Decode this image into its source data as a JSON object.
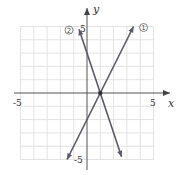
{
  "chart_data": {
    "type": "line",
    "title": "",
    "xlabel": "x",
    "ylabel": "y",
    "xlim": [
      -5,
      5
    ],
    "ylim": [
      -5,
      5
    ],
    "grid": true,
    "x_tick_labels": [
      "-5",
      "5"
    ],
    "y_tick_labels": [
      "5",
      "-5"
    ],
    "intersection": {
      "x": 1,
      "y": 0
    },
    "series": [
      {
        "name": "①",
        "label": "①",
        "equation": "y = 2x - 2",
        "slope": 2,
        "intercept": -2,
        "x_start": -1.5,
        "x_end": 3.5
      },
      {
        "name": "②",
        "label": "②",
        "equation": "y = -3x + 3",
        "slope": -3,
        "intercept": 3,
        "x_start": -0.6,
        "x_end": 2.6
      }
    ]
  }
}
